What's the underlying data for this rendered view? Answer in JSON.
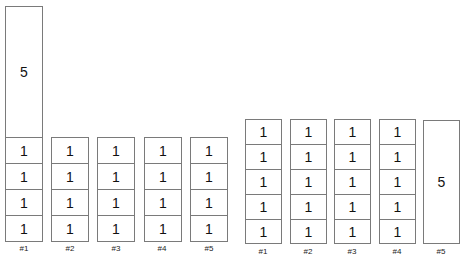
{
  "left_group": {
    "columns": [
      {
        "label": "#1",
        "cells": [
          "5",
          "1",
          "1",
          "1",
          "1"
        ]
      },
      {
        "label": "#2",
        "cells": [
          "1",
          "1",
          "1",
          "1"
        ]
      },
      {
        "label": "#3",
        "cells": [
          "1",
          "1",
          "1",
          "1"
        ]
      },
      {
        "label": "#4",
        "cells": [
          "1",
          "1",
          "1",
          "1"
        ]
      },
      {
        "label": "#5",
        "cells": [
          "1",
          "1",
          "1",
          "1"
        ]
      }
    ]
  },
  "right_group": {
    "columns": [
      {
        "label": "#1",
        "cells": [
          "1",
          "1",
          "1",
          "1",
          "1"
        ]
      },
      {
        "label": "#2",
        "cells": [
          "1",
          "1",
          "1",
          "1",
          "1"
        ]
      },
      {
        "label": "#3",
        "cells": [
          "1",
          "1",
          "1",
          "1",
          "1"
        ]
      },
      {
        "label": "#4",
        "cells": [
          "1",
          "1",
          "1",
          "1",
          "1"
        ]
      },
      {
        "label": "#5",
        "cells": [
          "5"
        ]
      }
    ]
  }
}
